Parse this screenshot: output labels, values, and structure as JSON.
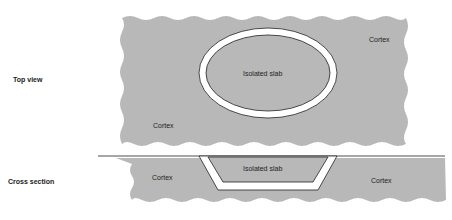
{
  "diagram": {
    "views": [
      {
        "label": "Top view"
      },
      {
        "label": "Cross section"
      }
    ],
    "top_view": {
      "slab_label": "Isolated slab",
      "cortex_labels": [
        "Cortex",
        "Cortex"
      ]
    },
    "cross_section": {
      "slab_label": "Isolated slab",
      "cortex_labels": [
        "Cortex",
        "Cortex"
      ]
    },
    "colors": {
      "cortex_fill": "#b8b8b8",
      "gap": "#ffffff",
      "outline": "#222222"
    }
  }
}
